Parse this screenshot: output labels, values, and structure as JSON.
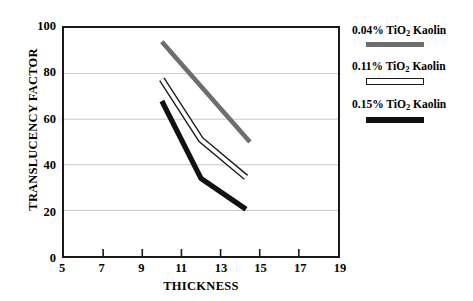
{
  "chart_data": {
    "type": "line",
    "title": "",
    "xlabel": "THICKNESS",
    "ylabel": "TRANSLUCENCY FACTOR",
    "xlim": [
      5,
      19
    ],
    "ylim": [
      0,
      100
    ],
    "xticks": [
      5,
      7,
      9,
      11,
      13,
      15,
      17,
      19
    ],
    "yticks": [
      0,
      20,
      40,
      60,
      80,
      100
    ],
    "grid": "horizontal",
    "legend_position": "right",
    "series": [
      {
        "name": "0.04% TiO2 Kaolin",
        "label_prefix": "0.04% TiO",
        "label_sub": "2",
        "label_suffix": " Kaolin",
        "style": "solid-gray",
        "color": "#6e6e6e",
        "x": [
          10,
          14.5
        ],
        "y": [
          94,
          50
        ]
      },
      {
        "name": "0.11% TiO2 Kaolin",
        "label_prefix": "0.11% TiO",
        "label_sub": "2",
        "label_suffix": " Kaolin",
        "style": "hollow-outline",
        "color": "#ffffff",
        "outline": "#1a1a1a",
        "x": [
          10,
          12,
          14.3
        ],
        "y": [
          77.5,
          51,
          34.5
        ]
      },
      {
        "name": "0.15% TiO2 Kaolin",
        "label_prefix": "0.15% TiO",
        "label_sub": "2",
        "label_suffix": " Kaolin",
        "style": "solid-black",
        "color": "#111111",
        "x": [
          10,
          12,
          14.3
        ],
        "y": [
          68,
          34,
          20.5
        ]
      }
    ]
  },
  "axes": {
    "ylabel": "TRANSLUCENCY FACTOR",
    "xlabel": "THICKNESS",
    "yticks": [
      "100",
      "80",
      "60",
      "40",
      "20",
      "0"
    ],
    "xticks": [
      "5",
      "7",
      "9",
      "11",
      "13",
      "15",
      "17",
      "19"
    ]
  },
  "legend": {
    "entries": [
      {
        "prefix": "0.04% TiO",
        "sub": "2",
        "suffix": " Kaolin"
      },
      {
        "prefix": "0.11% TiO",
        "sub": "2",
        "suffix": " Kaolin"
      },
      {
        "prefix": "0.15% TiO",
        "sub": "2",
        "suffix": " Kaolin"
      }
    ]
  }
}
